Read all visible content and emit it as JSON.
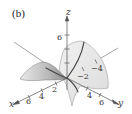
{
  "figure": {
    "panel_label": "(b)",
    "axes": {
      "x": {
        "name": "x",
        "ticks": [
          "2",
          "4",
          "6"
        ]
      },
      "y": {
        "name": "y",
        "ticks": [
          "4",
          "6"
        ],
        "negative_ticks": [
          "−2",
          "−4"
        ]
      },
      "z": {
        "name": "z",
        "ticks": [
          "6"
        ]
      }
    },
    "colors": {
      "axis": "#555555",
      "surface_light": "#e6e6e6",
      "surface_mid": "#cfcfcf",
      "surface_dark": "#9a9a9a",
      "curve": "#444444"
    }
  }
}
